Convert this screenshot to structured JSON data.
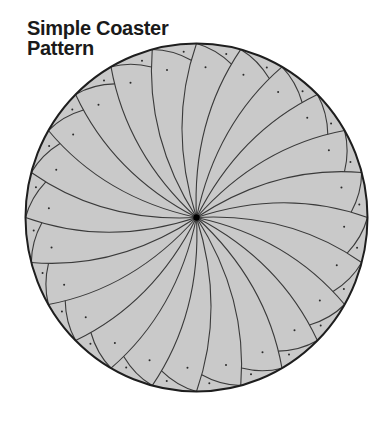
{
  "title": {
    "line1": "Simple Coaster",
    "line2": "Pattern"
  },
  "colors": {
    "fill": "#c9c9c9",
    "line": "#3a3a3a",
    "outline": "#1e1e1e",
    "dot": "#2a2a2a",
    "center_dot": "#000000",
    "title": "#1a1a1a"
  },
  "chart_data": {
    "type": "diagram",
    "title": "Simple Coaster Pattern",
    "shape": "circle",
    "center": [
      196.5,
      217.5
    ],
    "radius_x": 171,
    "radius_y": 174,
    "segments": 24,
    "segment_angle_deg": 15,
    "start_angle_deg": 0,
    "spoke": {
      "style": "curved spiral, bowing counter-clockwise, sweeping clockwise outward",
      "control_radius_frac": 0.55,
      "control_offset_deg": 18
    },
    "scallop_arc": {
      "from": "perimeter end of each spoke",
      "to": "next clockwise spoke",
      "meet_t": 0.9,
      "control_radius_frac": 0.975
    },
    "dots_per_segment": [
      {
        "radius_frac": 0.955,
        "offset_deg": 4.5,
        "label": "outer scallop dot"
      },
      {
        "radius_frac": 0.865,
        "offset_deg": 11.5,
        "label": "inner wedge dot"
      }
    ],
    "center_marker": "black dot"
  }
}
